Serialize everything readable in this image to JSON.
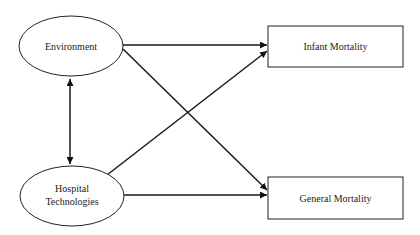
{
  "diagram": {
    "type": "path-model",
    "nodes": {
      "environment": {
        "label": "Environment",
        "shape": "ellipse"
      },
      "hospital_technologies": {
        "label_line1": "Hospital",
        "label_line2": "Technologies",
        "shape": "ellipse"
      },
      "infant_mortality": {
        "label": "Infant Mortality",
        "shape": "rectangle"
      },
      "general_mortality": {
        "label": "General Mortality",
        "shape": "rectangle"
      }
    },
    "edges": [
      {
        "from": "Environment",
        "to": "Hospital Technologies",
        "direction": "bidirectional"
      },
      {
        "from": "Environment",
        "to": "Infant Mortality",
        "direction": "directed"
      },
      {
        "from": "Environment",
        "to": "General Mortality",
        "direction": "directed"
      },
      {
        "from": "Hospital Technologies",
        "to": "Infant Mortality",
        "direction": "directed"
      },
      {
        "from": "Hospital Technologies",
        "to": "General Mortality",
        "direction": "directed"
      }
    ],
    "colors": {
      "stroke": "#222222",
      "background": "#ffffff",
      "text": "#1a1a1a"
    }
  }
}
